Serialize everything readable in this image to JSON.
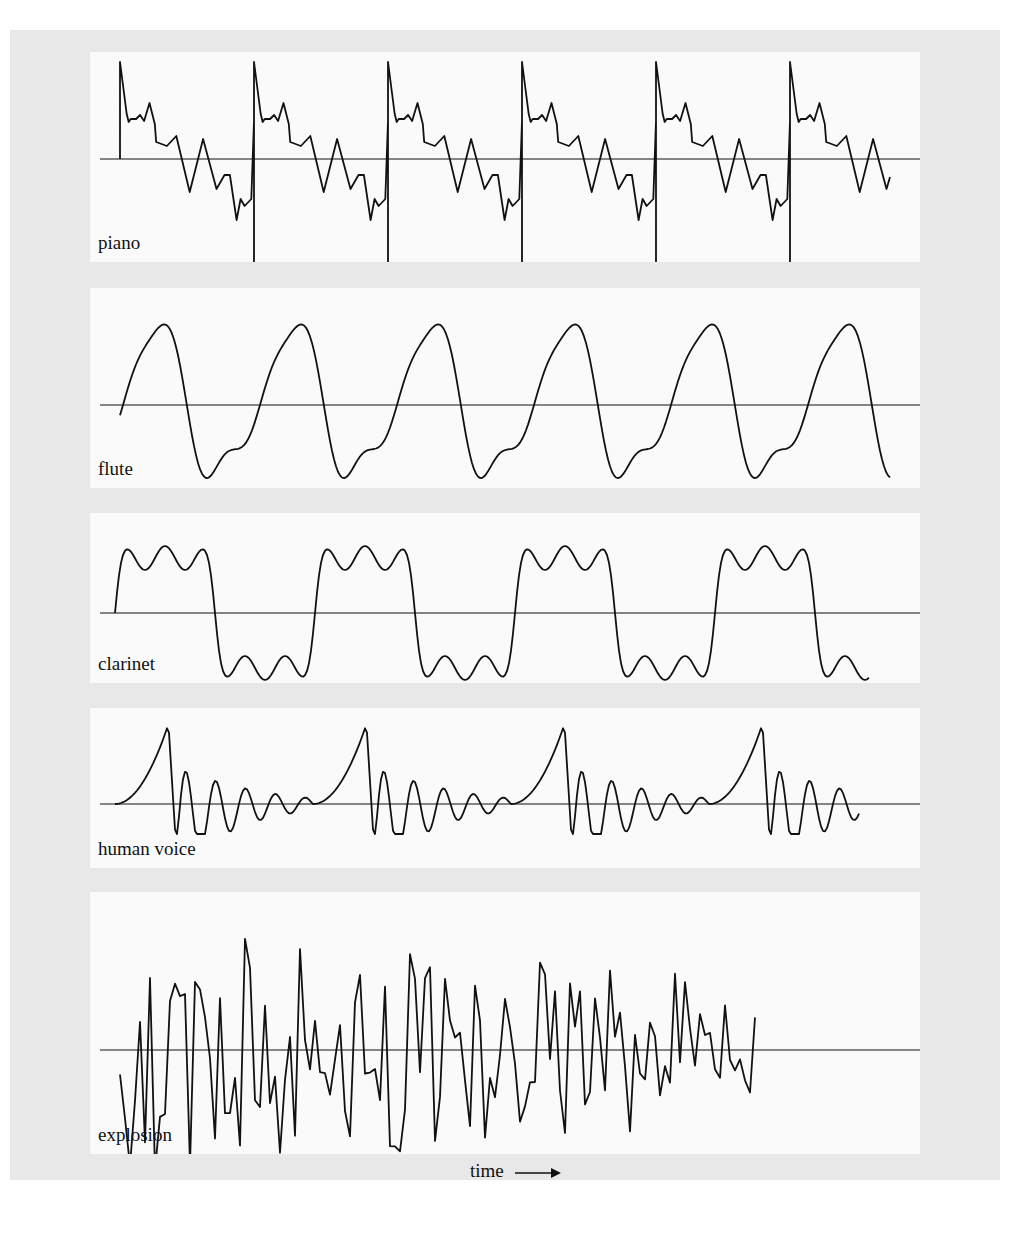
{
  "figure": {
    "background": "#e8e8e8",
    "panel_background": "#fafafa",
    "line_color": "#111111",
    "xlabel": "time"
  },
  "chart_data": {
    "type": "line",
    "title": "",
    "xlabel": "time →",
    "ylabel": "",
    "grid": false,
    "series": [
      {
        "name": "piano",
        "periodic": true,
        "cycles_shown": 6,
        "shape": "sharp spike at start of each cycle, jagged sawtooth descent crossing the baseline, sharp negative spike at end of cycle"
      },
      {
        "name": "flute",
        "periodic": true,
        "cycles_shown": 6,
        "shape": "smooth rounded wave with a shoulder on the descending slope, near-sinusoidal"
      },
      {
        "name": "clarinet",
        "periodic": true,
        "cycles_shown": 4,
        "shape": "square-like wave with ripples on the flat top and bottom"
      },
      {
        "name": "human voice",
        "periodic": true,
        "cycles_shown": 4,
        "shape": "large rising pulse followed by damped oscillations"
      },
      {
        "name": "explosion",
        "periodic": false,
        "cycles_shown": 0,
        "shape": "irregular noise-like waveform with large amplitude early, slowly decaying"
      }
    ]
  },
  "panels": [
    {
      "label": "piano"
    },
    {
      "label": "flute"
    },
    {
      "label": "clarinet"
    },
    {
      "label": "human voice"
    },
    {
      "label": "explosion"
    }
  ]
}
